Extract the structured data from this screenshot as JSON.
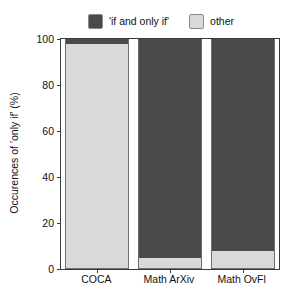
{
  "chart_data": {
    "type": "bar",
    "subtype": "stacked-bar-100-percent",
    "title": "",
    "xlabel": "",
    "ylabel": "Occurences of 'only if' (%)",
    "categories": [
      "COCA",
      "Math ArXiv",
      "Math OvFl"
    ],
    "series": [
      {
        "name": "'if and only if'",
        "color": "#4a4a4a",
        "values": [
          2,
          95,
          92
        ]
      },
      {
        "name": "other",
        "color": "#d9d9d9",
        "values": [
          98,
          5,
          8
        ]
      }
    ],
    "stack_order": [
      "other",
      "'if and only if'"
    ],
    "ylim": [
      0,
      100
    ],
    "yticks": [
      0,
      20,
      40,
      60,
      80,
      100
    ],
    "ytick_labels": [
      "0",
      "20",
      "40",
      "60",
      "80",
      "100"
    ],
    "grid": false,
    "legend_position": "top-center",
    "legend_entries": [
      {
        "label": "'if and only if'",
        "color": "#4a4a4a"
      },
      {
        "label": "other",
        "color": "#d9d9d9"
      }
    ]
  },
  "colors": {
    "dark": "#4a4a4a",
    "light": "#d9d9d9",
    "axis": "#3a3a3a",
    "background": "#ffffff"
  }
}
